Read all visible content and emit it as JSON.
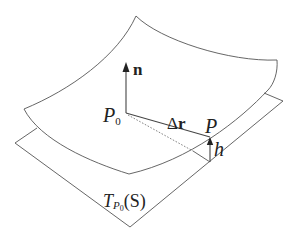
{
  "diagram": {
    "labels": {
      "normal": "n",
      "p0_main": "P",
      "p0_sub": "0",
      "delta_r_delta": "Δ",
      "delta_r_r": "r",
      "p": "P",
      "h": "h",
      "tangent_T": "T",
      "tangent_sub_P": "P",
      "tangent_sub_0": "0",
      "tangent_S": "(S)"
    },
    "colors": {
      "stroke": "#555555",
      "text": "#222222",
      "background": "#ffffff"
    }
  }
}
